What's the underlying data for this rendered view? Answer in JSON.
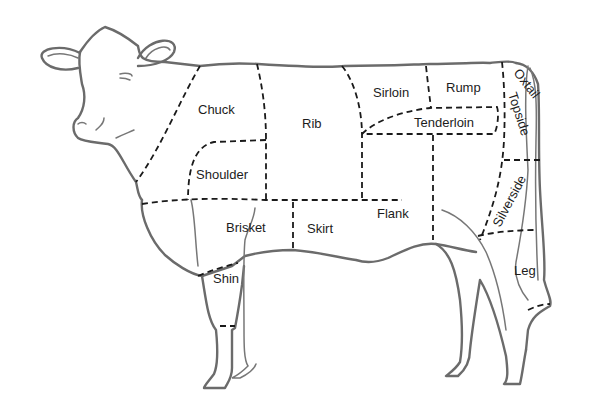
{
  "diagram": {
    "cuts": [
      {
        "name": "Chuck",
        "x": 198,
        "y": 114,
        "rotate": 0
      },
      {
        "name": "Rib",
        "x": 302,
        "y": 128,
        "rotate": 0
      },
      {
        "name": "Sirloin",
        "x": 373,
        "y": 97,
        "rotate": 0
      },
      {
        "name": "Rump",
        "x": 446,
        "y": 92,
        "rotate": 0
      },
      {
        "name": "Oxtail",
        "x": 513,
        "y": 73,
        "rotate": 52
      },
      {
        "name": "Topside",
        "x": 508,
        "y": 94,
        "rotate": 72
      },
      {
        "name": "Tenderloin",
        "x": 414,
        "y": 127,
        "rotate": 0
      },
      {
        "name": "Shoulder",
        "x": 196,
        "y": 179,
        "rotate": 0
      },
      {
        "name": "Brisket",
        "x": 226,
        "y": 232,
        "rotate": 0
      },
      {
        "name": "Skirt",
        "x": 307,
        "y": 233,
        "rotate": 0
      },
      {
        "name": "Flank",
        "x": 377,
        "y": 218,
        "rotate": 0
      },
      {
        "name": "Silverside",
        "x": 500,
        "y": 213,
        "rotate": -62
      },
      {
        "name": "Shin",
        "x": 213,
        "y": 283,
        "rotate": 0
      },
      {
        "name": "Leg",
        "x": 514,
        "y": 275,
        "rotate": 0
      }
    ]
  }
}
